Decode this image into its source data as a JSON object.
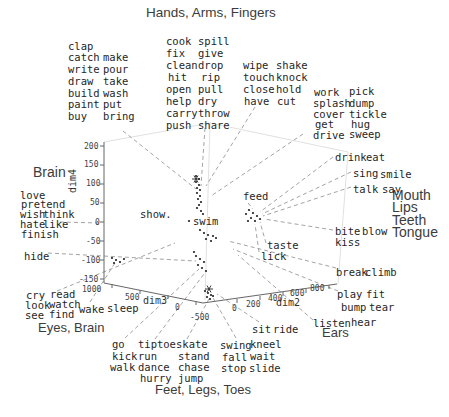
{
  "figure": {
    "background": "#ffffff",
    "word_color": "#1f1f1f",
    "annotation_color": "#3c3c3c",
    "axis_color": "#666666",
    "leader_color": "#999999",
    "box_color": "#dcdcdc",
    "point_color": "#222222"
  },
  "annotations": {
    "hands": "Hands, Arms, Fingers",
    "brain": "Brain",
    "eyes": "Eyes, Brain",
    "mouth_lines": [
      "Mouth",
      "Lips",
      "Teeth",
      "Tongue"
    ],
    "ears": "Ears",
    "feet": "Feet, Legs, Toes"
  },
  "chart_data": {
    "type": "scatter",
    "projection": "3d",
    "title": "",
    "axes": {
      "dim2": {
        "label": "dim2",
        "ticks": [
          0,
          200,
          400,
          600,
          800
        ]
      },
      "dim3": {
        "label": "dim3",
        "ticks": [
          1000,
          500,
          0,
          -500
        ]
      },
      "dim4": {
        "label": "dim4",
        "ticks": [
          200,
          150,
          100,
          50,
          0,
          -50,
          -100,
          -150
        ]
      }
    },
    "legend": "none",
    "grid": "off",
    "clusters": [
      {
        "category": "Hands, Arms, Fingers",
        "words": [
          "clap",
          "catch",
          "write",
          "draw",
          "build",
          "paint",
          "buy",
          "make",
          "pour",
          "take",
          "wash",
          "put",
          "bring",
          "cook",
          "fix",
          "clean",
          "hit",
          "open",
          "help",
          "carry",
          "push",
          "spill",
          "give",
          "drop",
          "rip",
          "pull",
          "dry",
          "throw",
          "share",
          "wipe",
          "touch",
          "close",
          "have",
          "shake",
          "knock",
          "hold",
          "cut",
          "work",
          "splash",
          "cover",
          "get",
          "drive",
          "pick",
          "dump",
          "tickle",
          "hug",
          "sweep"
        ]
      },
      {
        "category": "Brain",
        "words": [
          "love",
          "pretend",
          "wish",
          "think",
          "hate",
          "like",
          "finish",
          "hide",
          "show."
        ]
      },
      {
        "category": "Mouth, Lips, Teeth, Tongue",
        "words": [
          "drink",
          "eat",
          "sing",
          "smile",
          "talk",
          "say",
          "feed",
          "bite",
          "blow",
          "kiss",
          "taste",
          "lick",
          "break",
          "climb"
        ]
      },
      {
        "category": "Eyes, Brain",
        "words": [
          "cry",
          "read",
          "look",
          "watch",
          "see",
          "find",
          "wake",
          "sleep"
        ]
      },
      {
        "category": "Ears",
        "words": [
          "listen",
          "hear",
          "play",
          "fit",
          "bump",
          "tear"
        ]
      },
      {
        "category": "Feet, Legs, Toes",
        "words": [
          "go",
          "kick",
          "walk",
          "tiptoe",
          "run",
          "dance",
          "hurry",
          "skate",
          "stand",
          "chase",
          "jump",
          "swing",
          "kneel",
          "fall",
          "wait",
          "stop",
          "slide",
          "sit",
          "ride",
          "swim"
        ]
      }
    ]
  },
  "plot": {
    "width": 449,
    "height": 417,
    "axis_lines": [
      [
        104,
        142,
        104,
        283
      ],
      [
        104,
        283,
        203,
        303
      ],
      [
        203,
        303,
        337,
        284
      ]
    ],
    "box_lines": [
      [
        104,
        142,
        210,
        123
      ],
      [
        210,
        123,
        348,
        152
      ],
      [
        210,
        123,
        205,
        300
      ],
      [
        348,
        152,
        338,
        284
      ]
    ],
    "tick_marks": [
      [
        100,
        146,
        104,
        146
      ],
      [
        100,
        165,
        104,
        165
      ],
      [
        100,
        184,
        104,
        184
      ],
      [
        100,
        203,
        104,
        203
      ],
      [
        100,
        222,
        104,
        222
      ],
      [
        100,
        241,
        104,
        241
      ],
      [
        100,
        260,
        104,
        260
      ],
      [
        100,
        279,
        104,
        279
      ],
      [
        112,
        284,
        112,
        288
      ],
      [
        140,
        290,
        140,
        294
      ],
      [
        168,
        295,
        168,
        299
      ],
      [
        196,
        301,
        196,
        305
      ],
      [
        237,
        299,
        237,
        303
      ],
      [
        260,
        296,
        260,
        300
      ],
      [
        283,
        292,
        283,
        296
      ],
      [
        306,
        289,
        306,
        293
      ],
      [
        329,
        285,
        329,
        289
      ]
    ],
    "tick_labels": [
      {
        "t": "200",
        "x": 84,
        "y": 142
      },
      {
        "t": "150",
        "x": 84,
        "y": 160
      },
      {
        "t": "100",
        "x": 86,
        "y": 179
      },
      {
        "t": "50",
        "x": 90,
        "y": 198
      },
      {
        "t": "0",
        "x": 95,
        "y": 218
      },
      {
        "t": "-50",
        "x": 86,
        "y": 237
      },
      {
        "t": "-100",
        "x": 81,
        "y": 256
      },
      {
        "t": "-150",
        "x": 79,
        "y": 275
      },
      {
        "t": "1000",
        "x": 82,
        "y": 285
      },
      {
        "t": "500",
        "x": 125,
        "y": 293
      },
      {
        "t": "0",
        "x": 175,
        "y": 303
      },
      {
        "t": "-500",
        "x": 190,
        "y": 313
      },
      {
        "t": "0",
        "x": 232,
        "y": 304
      },
      {
        "t": "200",
        "x": 246,
        "y": 300
      },
      {
        "t": "400",
        "x": 268,
        "y": 294
      },
      {
        "t": "600",
        "x": 290,
        "y": 289
      },
      {
        "t": "800",
        "x": 310,
        "y": 284
      }
    ],
    "axis_names": [
      {
        "t": "dim4",
        "x": 76,
        "y": 193,
        "rotate": -90
      },
      {
        "t": "dim3",
        "x": 143,
        "y": 304,
        "rotate": 0
      },
      {
        "t": "dim2",
        "x": 276,
        "y": 306,
        "rotate": 0
      }
    ],
    "leader_lines": [
      [
        123,
        131,
        196,
        189
      ],
      [
        205,
        128,
        201,
        186
      ],
      [
        255,
        107,
        206,
        186
      ],
      [
        303,
        134,
        211,
        196
      ],
      [
        333,
        157,
        260,
        212
      ],
      [
        351,
        172,
        262,
        214
      ],
      [
        351,
        187,
        263,
        216
      ],
      [
        333,
        230,
        264,
        219
      ],
      [
        266,
        243,
        260,
        222
      ],
      [
        259,
        252,
        255,
        224
      ],
      [
        248,
        203,
        253,
        209
      ],
      [
        336,
        268,
        228,
        241
      ],
      [
        338,
        291,
        233,
        249
      ],
      [
        313,
        320,
        238,
        255
      ],
      [
        259,
        322,
        217,
        294
      ],
      [
        236,
        338,
        213,
        298
      ],
      [
        187,
        339,
        209,
        299
      ],
      [
        155,
        339,
        204,
        274
      ],
      [
        125,
        338,
        199,
        269
      ],
      [
        57,
        291,
        175,
        243
      ],
      [
        48,
        253,
        196,
        261
      ],
      [
        60,
        222,
        100,
        223
      ],
      [
        90,
        302,
        115,
        263
      ]
    ],
    "points": [
      [
        196,
        176
      ],
      [
        199,
        179
      ],
      [
        196,
        182
      ],
      [
        199,
        185
      ],
      [
        197,
        188
      ],
      [
        200,
        190
      ],
      [
        197,
        193
      ],
      [
        200,
        196
      ],
      [
        198,
        199
      ],
      [
        201,
        202
      ],
      [
        199,
        205
      ],
      [
        197,
        208
      ],
      [
        201,
        211
      ],
      [
        203,
        214
      ],
      [
        189,
        221
      ],
      [
        200,
        230
      ],
      [
        204,
        233
      ],
      [
        208,
        235
      ],
      [
        213,
        236
      ],
      [
        206,
        239
      ],
      [
        211,
        241
      ],
      [
        216,
        238
      ],
      [
        194,
        252
      ],
      [
        196,
        256
      ],
      [
        200,
        259
      ],
      [
        204,
        262
      ],
      [
        198,
        265
      ],
      [
        202,
        268
      ],
      [
        206,
        271
      ],
      [
        112,
        258
      ],
      [
        116,
        260
      ],
      [
        120,
        262
      ],
      [
        124,
        259
      ],
      [
        114,
        263
      ],
      [
        249,
        210
      ],
      [
        253,
        213
      ],
      [
        257,
        216
      ],
      [
        251,
        218
      ],
      [
        246,
        214
      ],
      [
        260,
        219
      ],
      [
        255,
        221
      ],
      [
        248,
        221
      ],
      [
        205,
        291
      ],
      [
        208,
        293
      ],
      [
        211,
        295
      ],
      [
        207,
        297
      ],
      [
        210,
        299
      ],
      [
        213,
        296
      ]
    ],
    "stars": [
      [
        196,
        179
      ],
      [
        209,
        289
      ]
    ],
    "words": [
      {
        "t": "clap",
        "x": 68,
        "y": 41
      },
      {
        "t": "catch",
        "x": 68,
        "y": 52
      },
      {
        "t": "write",
        "x": 68,
        "y": 64
      },
      {
        "t": "draw",
        "x": 68,
        "y": 76
      },
      {
        "t": "build",
        "x": 68,
        "y": 88
      },
      {
        "t": "paint",
        "x": 68,
        "y": 99
      },
      {
        "t": "buy",
        "x": 68,
        "y": 111
      },
      {
        "t": "make",
        "x": 103,
        "y": 52
      },
      {
        "t": "pour",
        "x": 103,
        "y": 64
      },
      {
        "t": "take",
        "x": 103,
        "y": 76
      },
      {
        "t": "wash",
        "x": 103,
        "y": 88
      },
      {
        "t": "put",
        "x": 103,
        "y": 99
      },
      {
        "t": "bring",
        "x": 103,
        "y": 111
      },
      {
        "t": "cook",
        "x": 166,
        "y": 36
      },
      {
        "t": "fix",
        "x": 166,
        "y": 48
      },
      {
        "t": "clean",
        "x": 166,
        "y": 60
      },
      {
        "t": "hit",
        "x": 168,
        "y": 72
      },
      {
        "t": "open",
        "x": 166,
        "y": 84
      },
      {
        "t": "help",
        "x": 166,
        "y": 96
      },
      {
        "t": "carry",
        "x": 166,
        "y": 108
      },
      {
        "t": "push",
        "x": 166,
        "y": 120
      },
      {
        "t": "spill",
        "x": 198,
        "y": 36
      },
      {
        "t": "give",
        "x": 198,
        "y": 48
      },
      {
        "t": "drop",
        "x": 198,
        "y": 60
      },
      {
        "t": "rip",
        "x": 201,
        "y": 72
      },
      {
        "t": "pull",
        "x": 198,
        "y": 84
      },
      {
        "t": "dry",
        "x": 198,
        "y": 96
      },
      {
        "t": "throw",
        "x": 198,
        "y": 108
      },
      {
        "t": "share",
        "x": 198,
        "y": 120
      },
      {
        "t": "wipe",
        "x": 243,
        "y": 60
      },
      {
        "t": "touch",
        "x": 243,
        "y": 72
      },
      {
        "t": "close",
        "x": 243,
        "y": 84
      },
      {
        "t": "have",
        "x": 244,
        "y": 96
      },
      {
        "t": "shake",
        "x": 276,
        "y": 60
      },
      {
        "t": "knock",
        "x": 276,
        "y": 72
      },
      {
        "t": "hold",
        "x": 276,
        "y": 84
      },
      {
        "t": "cut",
        "x": 277,
        "y": 96
      },
      {
        "t": "work",
        "x": 314,
        "y": 87
      },
      {
        "t": "splash",
        "x": 313,
        "y": 98
      },
      {
        "t": "cover",
        "x": 313,
        "y": 109
      },
      {
        "t": "get",
        "x": 315,
        "y": 119
      },
      {
        "t": "drive",
        "x": 313,
        "y": 130
      },
      {
        "t": "pick",
        "x": 349,
        "y": 86
      },
      {
        "t": "dump",
        "x": 349,
        "y": 98
      },
      {
        "t": "tickle",
        "x": 349,
        "y": 109
      },
      {
        "t": "hug",
        "x": 351,
        "y": 119
      },
      {
        "t": "sweep",
        "x": 349,
        "y": 129
      },
      {
        "t": "drink",
        "x": 335,
        "y": 152
      },
      {
        "t": "eat",
        "x": 366,
        "y": 152
      },
      {
        "t": "sing",
        "x": 353,
        "y": 168
      },
      {
        "t": "smile",
        "x": 380,
        "y": 169
      },
      {
        "t": "talk",
        "x": 353,
        "y": 184
      },
      {
        "t": "say",
        "x": 382,
        "y": 184
      },
      {
        "t": "feed",
        "x": 243,
        "y": 191
      },
      {
        "t": "bite",
        "x": 335,
        "y": 226
      },
      {
        "t": "blow",
        "x": 362,
        "y": 226
      },
      {
        "t": "kiss",
        "x": 335,
        "y": 237
      },
      {
        "t": "taste",
        "x": 267,
        "y": 240
      },
      {
        "t": "lick",
        "x": 261,
        "y": 251
      },
      {
        "t": "break",
        "x": 336,
        "y": 267
      },
      {
        "t": "climb",
        "x": 365,
        "y": 267
      },
      {
        "t": "show.",
        "x": 140,
        "y": 209
      },
      {
        "t": "swim",
        "x": 193,
        "y": 216
      },
      {
        "t": "love",
        "x": 20,
        "y": 190
      },
      {
        "t": "pretend",
        "x": 21,
        "y": 199
      },
      {
        "t": "wish",
        "x": 20,
        "y": 209
      },
      {
        "t": "think",
        "x": 43,
        "y": 209
      },
      {
        "t": "hate",
        "x": 20,
        "y": 219
      },
      {
        "t": "like",
        "x": 43,
        "y": 219
      },
      {
        "t": "finish",
        "x": 21,
        "y": 229
      },
      {
        "t": "hide",
        "x": 24,
        "y": 251
      },
      {
        "t": "cry",
        "x": 26,
        "y": 290
      },
      {
        "t": "read",
        "x": 50,
        "y": 289
      },
      {
        "t": "look",
        "x": 25,
        "y": 300
      },
      {
        "t": "watch",
        "x": 49,
        "y": 299
      },
      {
        "t": "see",
        "x": 25,
        "y": 310
      },
      {
        "t": "find",
        "x": 49,
        "y": 309
      },
      {
        "t": "wake",
        "x": 79,
        "y": 304
      },
      {
        "t": "sleep",
        "x": 107,
        "y": 303
      },
      {
        "t": "go",
        "x": 112,
        "y": 339
      },
      {
        "t": "kick",
        "x": 112,
        "y": 351
      },
      {
        "t": "walk",
        "x": 110,
        "y": 362
      },
      {
        "t": "tiptoe",
        "x": 138,
        "y": 339
      },
      {
        "t": "run",
        "x": 138,
        "y": 351
      },
      {
        "t": "dance",
        "x": 138,
        "y": 362
      },
      {
        "t": "hurry",
        "x": 140,
        "y": 373
      },
      {
        "t": "skate",
        "x": 176,
        "y": 339
      },
      {
        "t": "stand",
        "x": 178,
        "y": 351
      },
      {
        "t": "chase",
        "x": 178,
        "y": 362
      },
      {
        "t": "jump",
        "x": 178,
        "y": 373
      },
      {
        "t": "swing",
        "x": 220,
        "y": 340
      },
      {
        "t": "kneel",
        "x": 250,
        "y": 339
      },
      {
        "t": "fall",
        "x": 222,
        "y": 352
      },
      {
        "t": "wait",
        "x": 250,
        "y": 351
      },
      {
        "t": "stop",
        "x": 221,
        "y": 363
      },
      {
        "t": "slide",
        "x": 249,
        "y": 363
      },
      {
        "t": "sit",
        "x": 252,
        "y": 324
      },
      {
        "t": "ride",
        "x": 273,
        "y": 324
      },
      {
        "t": "listen",
        "x": 313,
        "y": 318
      },
      {
        "t": "hear",
        "x": 351,
        "y": 317
      },
      {
        "t": "play",
        "x": 337,
        "y": 289
      },
      {
        "t": "fit",
        "x": 366,
        "y": 289
      },
      {
        "t": "bump",
        "x": 341,
        "y": 302
      },
      {
        "t": "tear",
        "x": 369,
        "y": 302
      }
    ]
  }
}
